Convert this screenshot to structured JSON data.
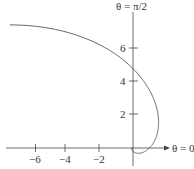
{
  "chart_data": {
    "type": "line",
    "subtype": "polar-curve",
    "title": "",
    "equation_inferred": "r = e^theta",
    "theta_range": [
      -3.14159,
      2.35619
    ],
    "axis_labels": {
      "polar_axis": "θ = 0",
      "vertical_axis": "θ = π/2"
    },
    "x_ticks": [
      -6,
      -4,
      -2
    ],
    "x_tick_labels": [
      "−6",
      "−4",
      "−2"
    ],
    "y_ticks": [
      2,
      4,
      6
    ],
    "y_tick_labels": [
      "2",
      "4",
      "6"
    ],
    "xlim": [
      -7.9,
      3.4
    ],
    "ylim": [
      -1.3,
      8.5
    ],
    "grid": false,
    "legend": null,
    "key_points": [
      {
        "theta": "3π/4",
        "x": -7.46,
        "y": 7.46
      },
      {
        "theta": "π/2",
        "x": 0,
        "y": 4.81
      },
      {
        "theta": "π/3",
        "x": 1.42,
        "y": 2.47
      },
      {
        "theta": "0",
        "x": 1,
        "y": 0
      },
      {
        "theta": "-π/2",
        "x": 0,
        "y": -0.21
      }
    ],
    "colors": {
      "curve": "#555555",
      "axes": "#444444",
      "text": "#333333"
    }
  }
}
